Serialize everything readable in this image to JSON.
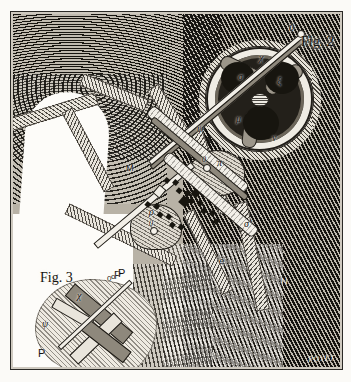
{
  "plate": {
    "kind": "antique-wood-engraving",
    "signature": "POYET",
    "paper_color": "#fbfaf7",
    "ink_color": "#14120e"
  },
  "figures": [
    {
      "id": "fig2",
      "label": "Fig. 2"
    },
    {
      "id": "fig3",
      "label": "Fig. 3"
    }
  ],
  "fig2": {
    "label": "Fig. 2",
    "labels": {
      "rod_top_end": "0",
      "chi_upper": "χ",
      "sigma": "σ",
      "xi": "ξ",
      "mu": "μ",
      "nu": "ν",
      "psi": "ψ",
      "pi": "π",
      "joint_zero": "0",
      "rho": "ρ",
      "rho_joint": "0",
      "sigma_prime": "σ′",
      "e": "e",
      "M": "M",
      "N": "N",
      "P": "P",
      "p_zero": "0"
    }
  },
  "fig3": {
    "label": "Fig. 3",
    "labels": {
      "chi": "χ",
      "psi": "ψ",
      "P_top": "P",
      "o_top": "o",
      "P_bottom": "P"
    }
  }
}
